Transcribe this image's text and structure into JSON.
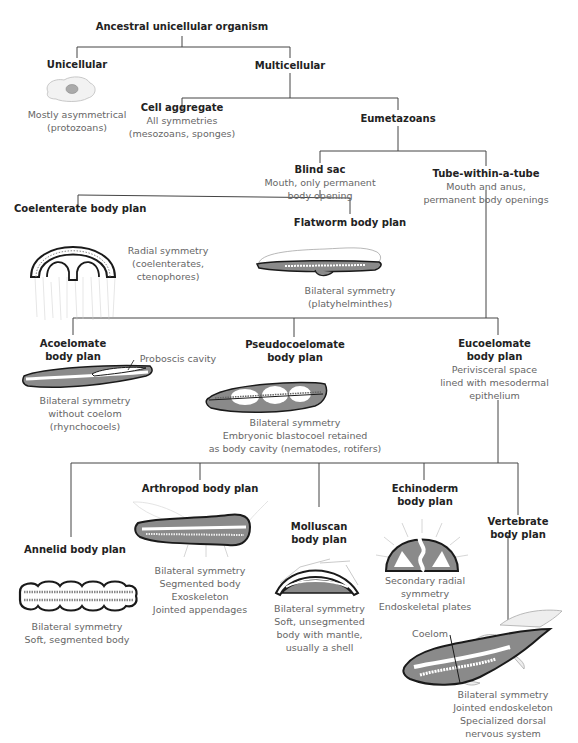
{
  "nodes": {
    "root": {
      "title": "Ancestral unicellular organism"
    },
    "unicellular": {
      "title": "Unicellular",
      "desc": [
        "Mostly asymmetrical",
        "(protozoans)"
      ]
    },
    "multicellular": {
      "title": "Multicellular"
    },
    "cell_aggregate": {
      "title": "Cell aggregate",
      "desc": [
        "All symmetries",
        "(mesozoans, sponges)"
      ]
    },
    "eumetazoans": {
      "title": "Eumetazoans"
    },
    "blind_sac": {
      "title": "Blind sac",
      "desc": [
        "Mouth, only permanent",
        "body opening"
      ]
    },
    "tube": {
      "title": "Tube-within-a-tube",
      "desc": [
        "Mouth and anus,",
        "permanent body openings"
      ]
    },
    "coelenterate": {
      "title": "Coelenterate body plan",
      "desc": [
        "Radial symmetry",
        "(coelenterates,",
        "ctenophores)"
      ]
    },
    "flatworm": {
      "title": "Flatworm body plan",
      "desc": [
        "Bilateral symmetry",
        "(platyhelminthes)"
      ]
    },
    "acoelomate": {
      "title": [
        "Acoelomate",
        "body plan"
      ],
      "annotation": "Proboscis cavity",
      "desc": [
        "Bilateral symmetry",
        "without coelom",
        "(rhynchocoels)"
      ]
    },
    "pseudocoelomate": {
      "title": [
        "Pseudocoelomate",
        "body plan"
      ],
      "desc": [
        "Bilateral symmetry",
        "Embryonic blastocoel retained",
        "as body cavity (nematodes, rotifers)"
      ]
    },
    "eucoelomate": {
      "title": [
        "Eucoelomate",
        "body plan"
      ],
      "desc": [
        "Perivisceral space",
        "lined with mesodermal",
        "epithelium"
      ]
    },
    "annelid": {
      "title": "Annelid body plan",
      "desc": [
        "Bilateral symmetry",
        "Soft, segmented body"
      ]
    },
    "arthropod": {
      "title": "Arthropod body plan",
      "desc": [
        "Bilateral symmetry",
        "Segmented body",
        "Exoskeleton",
        "Jointed appendages"
      ]
    },
    "molluscan": {
      "title": [
        "Molluscan",
        "body plan"
      ],
      "desc": [
        "Bilateral symmetry",
        "Soft, unsegmented",
        "body with mantle,",
        "usually a shell"
      ]
    },
    "echinoderm": {
      "title": [
        "Echinoderm",
        "body plan"
      ],
      "desc": [
        "Secondary radial",
        "symmetry",
        "Endoskeletal plates"
      ]
    },
    "vertebrate": {
      "title": [
        "Vertebrate",
        "body plan"
      ],
      "annotation": "Coelom",
      "desc": [
        "Bilateral symmetry",
        "Jointed endoskeleton",
        "Specialized dorsal",
        "nervous system"
      ]
    }
  },
  "colors": {
    "line": "#444444",
    "body_fill": "#8a8a8a",
    "outline": "#1a1a1a",
    "text": "#666666",
    "title": "#222222"
  }
}
